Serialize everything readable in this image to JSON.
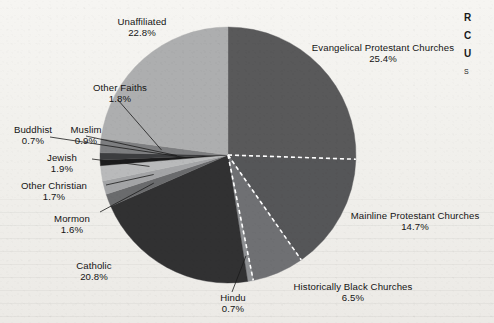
{
  "figure": {
    "background_color": "#f1f0ec",
    "divider_color": "#ffffff"
  },
  "edge_fragment": {
    "line1": "R",
    "line2": "C",
    "line3": "U",
    "line4": "S"
  },
  "chart_data": {
    "type": "pie",
    "title": "",
    "subtitle": "",
    "xlabel": "",
    "ylabel": "",
    "units": "percent",
    "legend_position": "none",
    "grid": false,
    "label_format": "{name}\n{value}%",
    "start_angle_deg": -90,
    "direction": "clockwise",
    "categories": [
      "Evangelical Protestant Churches",
      "Mainline Protestant Churches",
      "Historically Black Churches",
      "Hindu",
      "Catholic",
      "Mormon",
      "Other Christian",
      "Jewish",
      "Buddhist",
      "Muslim",
      "Other Faiths",
      "Unaffiliated"
    ],
    "values": [
      25.4,
      14.7,
      6.5,
      0.7,
      20.8,
      1.6,
      1.7,
      1.9,
      0.7,
      0.9,
      1.8,
      22.8
    ],
    "colors": [
      "#59595a",
      "#555658",
      "#6f7073",
      "#8e9093",
      "#313132",
      "#6a6b6d",
      "#a3a4a6",
      "#b9babb",
      "#1b1b1c",
      "#3c3d3f",
      "#7d7e80",
      "#adaeaf"
    ],
    "slices": [
      {
        "name": "Evangelical Protestant Churches",
        "value": 25.4,
        "label": "Evangelical Protestant Churches",
        "percent_label": "25.4%"
      },
      {
        "name": "Mainline Protestant Churches",
        "value": 14.7,
        "label": "Mainline Protestant Churches",
        "percent_label": "14.7%"
      },
      {
        "name": "Historically Black Churches",
        "value": 6.5,
        "label": "Historically Black Churches",
        "percent_label": "6.5%"
      },
      {
        "name": "Hindu",
        "value": 0.7,
        "label": "Hindu",
        "percent_label": "0.7%"
      },
      {
        "name": "Catholic",
        "value": 20.8,
        "label": "Catholic",
        "percent_label": "20.8%"
      },
      {
        "name": "Mormon",
        "value": 1.6,
        "label": "Mormon",
        "percent_label": "1.6%"
      },
      {
        "name": "Other Christian",
        "value": 1.7,
        "label": "Other Christian",
        "percent_label": "1.7%"
      },
      {
        "name": "Jewish",
        "value": 1.9,
        "label": "Jewish",
        "percent_label": "1.9%"
      },
      {
        "name": "Buddhist",
        "value": 0.7,
        "label": "Buddhist",
        "percent_label": "0.7%"
      },
      {
        "name": "Muslim",
        "value": 0.9,
        "label": "Muslim",
        "percent_label": "0.9%"
      },
      {
        "name": "Other Faiths",
        "value": 1.8,
        "label": "Other Faiths",
        "percent_label": "1.8%"
      },
      {
        "name": "Unaffiliated",
        "value": 22.8,
        "label": "Unaffiliated",
        "percent_label": "22.8%"
      }
    ]
  }
}
